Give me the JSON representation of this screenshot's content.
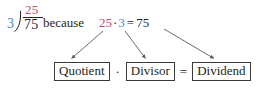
{
  "colors": {
    "quotient_red": "#c14a6d",
    "divisor_blue": "#3f8ecf",
    "text_black": "#231f20",
    "box_border": "#3a3a3a",
    "arrow": "#5a5a5a",
    "background": "#ffffff"
  },
  "long_division": {
    "quotient": "25",
    "divisor": "3",
    "dividend": "75"
  },
  "connective": "because",
  "equation": {
    "left_factor": "25",
    "operator": "·",
    "right_factor": "3",
    "equals": "=",
    "product": "75"
  },
  "labels": {
    "quotient_box": "Quotient",
    "multiply_op": "·",
    "divisor_box": "Divisor",
    "equals_op": "=",
    "dividend_box": "Dividend"
  },
  "arrows": [
    {
      "name": "arrow-quotient",
      "from": "25",
      "to": "Quotient"
    },
    {
      "name": "arrow-divisor",
      "from": "3",
      "to": "Divisor"
    },
    {
      "name": "arrow-dividend",
      "from": "75",
      "to": "Dividend"
    }
  ]
}
